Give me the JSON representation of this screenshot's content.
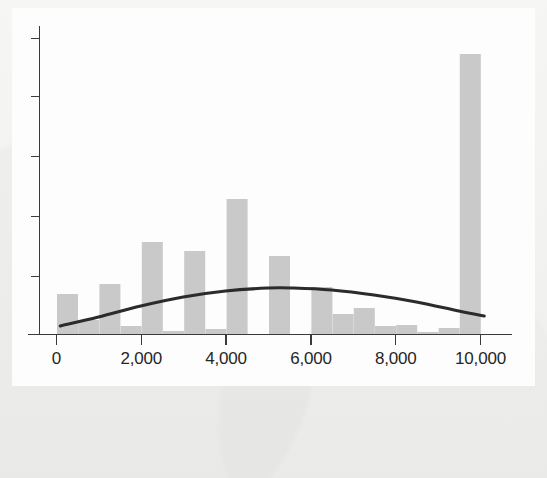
{
  "figure": {
    "title": "",
    "background_color": "#f4f4f3",
    "panel_color": "#fdfdfd",
    "bar_color": "#c9c9c9",
    "curve_color": "#2b2b2b",
    "axis_color": "#3a3a3a"
  },
  "chart_data": {
    "type": "bar",
    "title": "",
    "subtitle": "",
    "xlabel": "",
    "ylabel": "",
    "xlim": [
      -200,
      10450
    ],
    "ylim": [
      0,
      340
    ],
    "grid": false,
    "legend": null,
    "annotations": [],
    "x_tick_labels": [
      "0",
      "2,000",
      "4,000",
      "6,000",
      "8,000",
      "10,000"
    ],
    "x_tick_values": [
      0,
      2000,
      4000,
      6000,
      8000,
      10000
    ],
    "y_tick_labels": [],
    "y_tick_count": 6,
    "y_tick_values": [
      0,
      58,
      118,
      178,
      238,
      296
    ],
    "bin_width": 500,
    "bar_pixel_width": 21,
    "categories": [
      "0–500",
      "500–1,000",
      "1,000–1,500",
      "1,500–2,000",
      "2,000–2,500",
      "2,500–3,000",
      "3,000–3,500",
      "3,500–4,000",
      "4,000–4,500",
      "4,500–5,000",
      "5,000–5,500",
      "5,500–6,000",
      "6,000–6,500",
      "6,500–7,000",
      "7,000–7,500",
      "7,500–8,000",
      "8,000–8,500",
      "8,500–9,000",
      "9,000–9,500",
      "9,500–10,000"
    ],
    "bin_starts": [
      0,
      500,
      1000,
      1500,
      2000,
      2500,
      3000,
      3500,
      4000,
      4500,
      5000,
      5500,
      6000,
      6500,
      7000,
      7500,
      8000,
      8500,
      9000,
      9500
    ],
    "values": [
      40,
      14,
      50,
      8,
      92,
      3,
      83,
      5,
      135,
      0,
      78,
      0,
      47,
      20,
      26,
      8,
      9,
      2,
      6,
      280
    ],
    "series": [
      {
        "name": "Frequency",
        "values": [
          40,
          14,
          50,
          8,
          92,
          3,
          83,
          5,
          135,
          0,
          78,
          0,
          47,
          20,
          26,
          8,
          9,
          2,
          6,
          280
        ]
      },
      {
        "name": "Fitted curve",
        "type": "line",
        "x": [
          100,
          1000,
          2000,
          3000,
          4000,
          5000,
          5600,
          6500,
          7500,
          8500,
          9500,
          10100
        ],
        "values": [
          8,
          17,
          28,
          37,
          43,
          46,
          46,
          44,
          39,
          32,
          23,
          18
        ]
      }
    ]
  }
}
